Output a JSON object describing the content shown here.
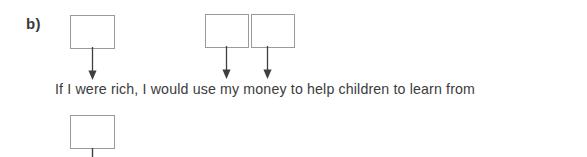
{
  "exercise": {
    "item_label": "b)",
    "sentence": "If I were rich, I would use my money to help children to learn from",
    "boxes": [
      {
        "name": "answer-box-1",
        "value": "",
        "x": 70,
        "y": 15,
        "width": 45,
        "height": 34
      },
      {
        "name": "answer-box-2",
        "value": "",
        "x": 205,
        "y": 14,
        "width": 44,
        "height": 34
      },
      {
        "name": "answer-box-3",
        "value": "",
        "x": 251,
        "y": 14,
        "width": 44,
        "height": 34
      },
      {
        "name": "answer-box-4",
        "value": "",
        "x": 70,
        "y": 115,
        "width": 45,
        "height": 34
      }
    ],
    "arrows": [
      {
        "name": "arrow-to-rich",
        "target_word": "rich",
        "x": 92,
        "from_y": 49,
        "to_y": 80
      },
      {
        "name": "arrow-to-use",
        "target_word": "use",
        "x": 226,
        "from_y": 48,
        "to_y": 80
      },
      {
        "name": "arrow-to-my",
        "target_word": "my",
        "x": 267,
        "from_y": 48,
        "to_y": 80
      }
    ],
    "stem_line": {
      "name": "stem-line-below-box-4",
      "x": 92,
      "from_y": 149,
      "to_y": 157
    },
    "colors": {
      "box_border": "#9a9a9a",
      "text": "#3c3c3c",
      "label": "#3b3b3b",
      "arrow": "#3f3f3f",
      "background": "#ffffff"
    },
    "layout": {
      "label_x": 26,
      "label_y": 16,
      "sentence_x": 55,
      "sentence_baseline_y": 87
    }
  }
}
